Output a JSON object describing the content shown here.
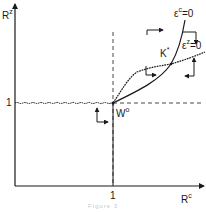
{
  "diagram": {
    "axes": {
      "y_label_base": "R",
      "y_label_sup": "z",
      "x_label_base": "R",
      "x_label_sup": "c",
      "y_tick_label": "1",
      "x_tick_label": "1"
    },
    "curves": {
      "epsilon_c": {
        "label_base": "ε",
        "label_sup": "c",
        "label_suffix": "=0"
      },
      "epsilon_z": {
        "label_base": "ε",
        "label_sup": "z",
        "label_suffix": "=0"
      }
    },
    "points": {
      "w_origin": {
        "label_base": "W",
        "label_sup": "o"
      },
      "k_star": {
        "label_base": "K",
        "label_sup": "*"
      }
    },
    "caption": "Figure 3"
  },
  "colors": {
    "ink": "#1a1a1a",
    "dashed": "#333333",
    "background": "#ffffff"
  }
}
